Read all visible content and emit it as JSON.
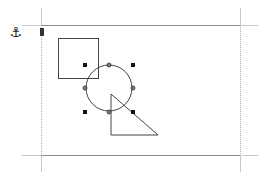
{
  "document": {
    "anchor_icon": "⚓",
    "page": {
      "left": 41,
      "top": 25,
      "right": 240,
      "bottom": 155,
      "border_color": "#7a7a7a",
      "crop_mark_color": "#c8c8c8"
    },
    "shapes": {
      "square": {
        "x": 58,
        "y": 38,
        "width": 40,
        "height": 40,
        "stroke": "#444444"
      },
      "circle": {
        "cx": 109,
        "cy": 88,
        "r": 23,
        "stroke": "#444444",
        "selected": true
      },
      "triangle": {
        "points": "111,94 111,135 158,135",
        "stroke": "#444444"
      }
    },
    "selection": {
      "handle_color": "#111111",
      "corner_handles": [
        [
          85,
          65
        ],
        [
          133,
          65
        ],
        [
          85,
          112
        ],
        [
          133,
          112
        ]
      ],
      "glue_points": [
        [
          109,
          65
        ],
        [
          85,
          88
        ],
        [
          133,
          88
        ],
        [
          109,
          112
        ]
      ]
    }
  }
}
